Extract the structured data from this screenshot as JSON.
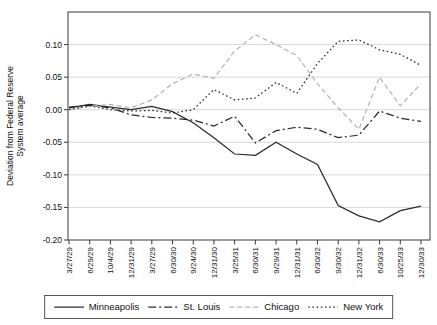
{
  "chart_meta": {
    "ylabel_line1": "Deviation from Federal Reserve",
    "ylabel_line2": "System average"
  },
  "colors": {
    "axis": "#3a3a3a",
    "grid": "#d4d4d4",
    "text": "#111111",
    "dark_series": "#2b2b2b",
    "light_series": "#b5b5b5"
  },
  "chart_data": {
    "type": "line",
    "title": "",
    "xlabel": "",
    "ylabel": "Deviation from Federal Reserve System average",
    "ylim": [
      -0.2,
      0.15
    ],
    "y_ticks": [
      0.1,
      0.05,
      0.0,
      -0.05,
      -0.1,
      -0.15,
      -0.2
    ],
    "y_tick_labels": [
      "0.10",
      "0.05",
      "0.00",
      "-0.05",
      "-0.10",
      "-0.15",
      "-0.20"
    ],
    "grid": true,
    "legend_position": "bottom",
    "categories": [
      "3/27/29",
      "6/29/29",
      "10/4/29",
      "12/31/29",
      "3/27/29",
      "6/30/30",
      "9/24/30",
      "12/31/30",
      "3/25/31",
      "6/30/31",
      "9/29/31",
      "12/31/31",
      "6/30/32",
      "9/30/32",
      "12/31/32",
      "6/30/33",
      "10/25/33",
      "12/30/33"
    ],
    "series": [
      {
        "name": "Minneapolis",
        "dash": "solid",
        "color": "#2b2b2b",
        "values": [
          0.003,
          0.008,
          0.004,
          0.0,
          0.005,
          -0.003,
          -0.02,
          -0.043,
          -0.068,
          -0.07,
          -0.05,
          -0.068,
          -0.084,
          -0.147,
          -0.163,
          -0.172,
          -0.155,
          -0.148
        ]
      },
      {
        "name": "St. Louis",
        "dash": "dash-dot",
        "color": "#2b2b2b",
        "values": [
          0.004,
          0.007,
          0.003,
          -0.008,
          -0.012,
          -0.013,
          -0.016,
          -0.025,
          -0.01,
          -0.051,
          -0.032,
          -0.027,
          -0.03,
          -0.043,
          -0.039,
          -0.002,
          -0.013,
          -0.018
        ]
      },
      {
        "name": "Chicago",
        "dash": "dashed",
        "color": "#b5b5b5",
        "values": [
          0.0,
          0.005,
          0.008,
          0.003,
          0.015,
          0.04,
          0.055,
          0.048,
          0.09,
          0.115,
          0.1,
          0.083,
          0.04,
          0.003,
          -0.03,
          0.05,
          0.006,
          0.04
        ]
      },
      {
        "name": "New York",
        "dash": "dotted",
        "color": "#2b2b2b",
        "values": [
          0.0,
          0.006,
          0.0,
          -0.002,
          -0.001,
          -0.005,
          0.0,
          0.031,
          0.015,
          0.018,
          0.042,
          0.025,
          0.071,
          0.105,
          0.107,
          0.092,
          0.085,
          0.068
        ]
      }
    ]
  }
}
